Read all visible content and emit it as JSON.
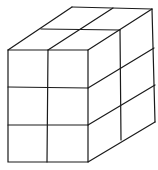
{
  "diagram": {
    "type": "isometric-cuboid",
    "grid": {
      "width": 2,
      "depth": 2,
      "height": 3
    },
    "stroke_color": "#1a1a1a",
    "background": "#ffffff"
  }
}
